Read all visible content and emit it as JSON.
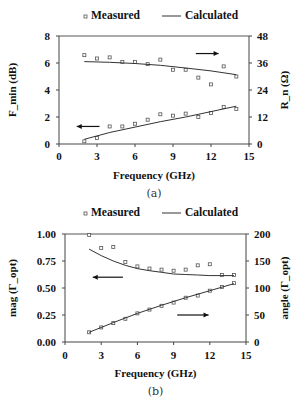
{
  "chart_data": [
    {
      "type": "scatter",
      "panel_label": "(a)",
      "legend": {
        "measured": "Measured",
        "calculated": "Calculated"
      },
      "xlabel": "Frequency (GHz)",
      "ylabel_left": "F_min (dB)",
      "ylabel_right": "R_n (Ω)",
      "xlim": [
        0,
        15
      ],
      "xticks": [
        0,
        3,
        6,
        9,
        12,
        15
      ],
      "ylim_left": [
        0,
        8
      ],
      "yticks_left": [
        0,
        2,
        4,
        6,
        8
      ],
      "ylim_right": [
        0,
        48
      ],
      "yticks_right": [
        0,
        12,
        24,
        36,
        48
      ],
      "series": [
        {
          "name": "Rn measured",
          "axis": "right",
          "kind": "markers",
          "x": [
            2,
            3,
            4,
            5,
            6,
            7,
            8,
            9,
            10,
            11,
            12,
            13,
            14
          ],
          "y": [
            39.5,
            38,
            38.5,
            36.5,
            36.5,
            35.5,
            37.5,
            33,
            33,
            29.5,
            26.5,
            34.5,
            30
          ]
        },
        {
          "name": "Rn calculated",
          "axis": "right",
          "kind": "line",
          "x": [
            2,
            4,
            6,
            8,
            10,
            12,
            14
          ],
          "y": [
            36.6,
            36.3,
            35.8,
            35,
            33.8,
            32.5,
            30.8
          ]
        },
        {
          "name": "Fmin measured",
          "axis": "left",
          "kind": "markers",
          "x": [
            2,
            3,
            4,
            5,
            6,
            7,
            8,
            9,
            10,
            11,
            12,
            13,
            14
          ],
          "y": [
            0.2,
            0.45,
            1.3,
            1.3,
            1.5,
            1.8,
            2.2,
            2.1,
            2.25,
            2.0,
            2.3,
            2.75,
            2.6
          ]
        },
        {
          "name": "Fmin calculated",
          "axis": "left",
          "kind": "line",
          "x": [
            2,
            4,
            6,
            8,
            10,
            12,
            14
          ],
          "y": [
            0.35,
            0.85,
            1.25,
            1.65,
            2.0,
            2.4,
            2.8
          ]
        }
      ],
      "annotations": [
        {
          "type": "arrow",
          "direction": "left",
          "x": [
            3.2,
            1.4
          ],
          "y_left": 1.3
        },
        {
          "type": "arrow",
          "direction": "right",
          "x": [
            10.8,
            12.6
          ],
          "y_left": 6.7
        }
      ]
    },
    {
      "type": "scatter",
      "panel_label": "(b)",
      "legend": {
        "measured": "Measured",
        "calculated": "Calculated"
      },
      "xlabel": "Frequency (GHz)",
      "ylabel_left": "mag (Γ_opt)",
      "ylabel_right": "angle (Γ_opt)",
      "xlim": [
        0,
        15
      ],
      "xticks": [
        0,
        3,
        6,
        9,
        12,
        15
      ],
      "ylim_left": [
        0,
        1
      ],
      "yticks_left": [
        "0.00",
        "0.25",
        "0.50",
        "0.75",
        "1.00"
      ],
      "ylim_right": [
        0,
        200
      ],
      "yticks_right": [
        0,
        50,
        100,
        150,
        200
      ],
      "series": [
        {
          "name": "mag measured",
          "axis": "left",
          "kind": "markers",
          "x": [
            2,
            3,
            4,
            5,
            6,
            7,
            8,
            9,
            10,
            11,
            12,
            13,
            14
          ],
          "y": [
            0.99,
            0.87,
            0.88,
            0.74,
            0.7,
            0.68,
            0.67,
            0.66,
            0.67,
            0.71,
            0.72,
            0.62,
            0.62
          ]
        },
        {
          "name": "mag calculated",
          "axis": "left",
          "kind": "line",
          "x": [
            2,
            3,
            4,
            5,
            6,
            7,
            8,
            9,
            10,
            11,
            12,
            13,
            14
          ],
          "y": [
            0.86,
            0.8,
            0.75,
            0.71,
            0.68,
            0.66,
            0.645,
            0.63,
            0.625,
            0.62,
            0.615,
            0.615,
            0.615
          ]
        },
        {
          "name": "angle measured",
          "axis": "right",
          "kind": "markers",
          "x": [
            2,
            3,
            4,
            5,
            6,
            7,
            8,
            9,
            10,
            11,
            12,
            13,
            14
          ],
          "y": [
            18,
            27,
            35,
            43,
            53,
            60,
            67,
            73,
            82,
            86,
            95,
            102,
            109
          ]
        },
        {
          "name": "angle calculated",
          "axis": "right",
          "kind": "line",
          "x": [
            2,
            4,
            6,
            8,
            10,
            12,
            14
          ],
          "y": [
            18,
            36,
            53,
            68,
            82,
            95,
            108
          ]
        }
      ],
      "annotations": [
        {
          "type": "arrow",
          "direction": "left",
          "x": [
            4.8,
            2.3
          ],
          "y_left": 0.6
        },
        {
          "type": "arrow",
          "direction": "right",
          "x": [
            9.3,
            11.9
          ],
          "y_left": 0.25
        }
      ]
    }
  ]
}
